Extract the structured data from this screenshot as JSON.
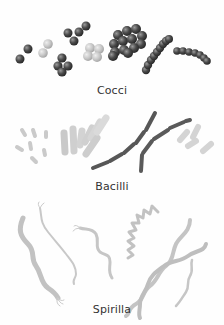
{
  "diagram": {
    "colors": {
      "dark_cell": "#4a4a4a",
      "light_cell": "#c8c8c8",
      "spiral": "#c4c4c4",
      "caption": "#333333",
      "background": "#fefefe"
    },
    "sections": [
      {
        "id": "cocci",
        "label": "Cocci",
        "description": "spherical bacteria: diplococci, tetrads, sarcinae, staphylococci, streptococci"
      },
      {
        "id": "bacilli",
        "label": "Bacilli",
        "description": "rod-shaped bacteria: single rods, palisades, streptobacilli"
      },
      {
        "id": "spirilla",
        "label": "Spirilla",
        "description": "spiral-shaped bacteria with flagella"
      }
    ]
  }
}
